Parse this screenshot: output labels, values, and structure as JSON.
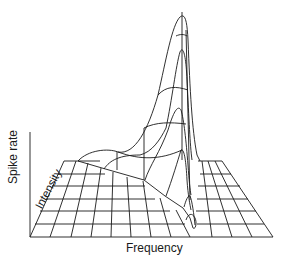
{
  "figure": {
    "type": "3d-wireframe-surface",
    "axes": {
      "x_label": "Frequency",
      "y_label": "Spike rate",
      "depth_label": "Intensity"
    },
    "colors": {
      "line": "#1a1a1a",
      "background": "#ffffff"
    }
  }
}
